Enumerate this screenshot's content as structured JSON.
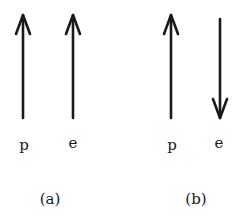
{
  "colors": {
    "background": "#ffffff",
    "ink": "#1a1a1a"
  },
  "panels": [
    {
      "caption": "(a)",
      "arrows": [
        {
          "label": "p",
          "direction": "up",
          "icon": "arrow-up-icon"
        },
        {
          "label": "e",
          "direction": "up",
          "icon": "arrow-up-icon"
        }
      ]
    },
    {
      "caption": "(b)",
      "arrows": [
        {
          "label": "p",
          "direction": "up",
          "icon": "arrow-up-icon"
        },
        {
          "label": "e",
          "direction": "down",
          "icon": "arrow-down-icon"
        }
      ]
    }
  ]
}
